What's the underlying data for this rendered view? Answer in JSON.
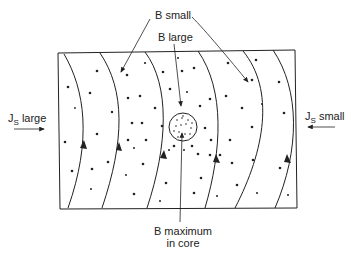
{
  "labels": {
    "b_small": "B small",
    "b_large": "B large",
    "js_large_main": "J",
    "js_large_sub": "S",
    "js_large_rest": " large",
    "js_small_main": "J",
    "js_small_sub": "S",
    "js_small_rest": " small",
    "b_max_line1": "B maximum",
    "b_max_line2": "in core"
  },
  "colors": {
    "line": "#222222",
    "background": "#ffffff"
  }
}
